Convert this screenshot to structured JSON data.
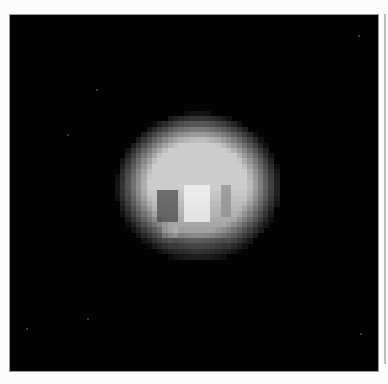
{
  "image": {
    "description": "Pixelated grayscale image of a planetary body on a black background",
    "background_color": "#030303",
    "page_color": "#fbfbfb"
  },
  "body": {
    "center_x": 188,
    "center_y": 172,
    "radius_x": 78,
    "radius_y": 71,
    "cell_size": 5.3,
    "base_brightness": 205,
    "features": [
      {
        "name": "dark-patch-left",
        "x": 148,
        "y": 173,
        "w": 22,
        "h": 35,
        "brightness": 70
      },
      {
        "name": "bright-spot-center",
        "x": 175,
        "y": 170,
        "w": 25,
        "h": 35,
        "brightness": 250
      },
      {
        "name": "dark-band-right",
        "x": 209,
        "y": 170,
        "w": 10,
        "h": 32,
        "brightness": 140
      },
      {
        "name": "bright-spot-lower-left",
        "x": 150,
        "y": 213,
        "w": 20,
        "h": 12,
        "brightness": 215
      },
      {
        "name": "dim-band-lower",
        "x": 165,
        "y": 222,
        "w": 50,
        "h": 20,
        "brightness": 120
      }
    ]
  },
  "speckles": [
    {
      "x": 86,
      "y": 74
    },
    {
      "x": 57,
      "y": 119
    },
    {
      "x": 77,
      "y": 303
    },
    {
      "x": 348,
      "y": 20
    },
    {
      "x": 350,
      "y": 318
    },
    {
      "x": 16,
      "y": 313
    }
  ]
}
